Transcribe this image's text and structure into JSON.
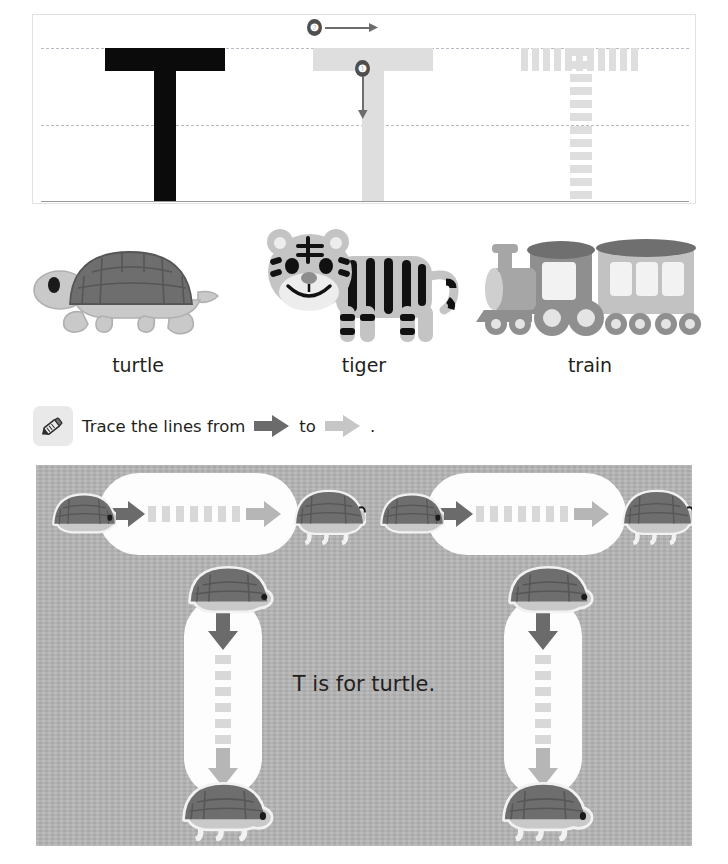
{
  "worksheet": {
    "letter": "T",
    "letter_case": "uppercase",
    "stroke_order": [
      {
        "number": "1",
        "direction": "down",
        "label_glyph": "❶"
      },
      {
        "number": "2",
        "direction": "right",
        "label_glyph": "❷"
      }
    ],
    "trace_models": [
      {
        "style": "solid",
        "color": "#0b0b0b",
        "name": "model-letter"
      },
      {
        "style": "ghost",
        "color": "#dededf",
        "name": "guided-letter"
      },
      {
        "style": "dotted",
        "color": "#dededf",
        "name": "dotted-letter"
      }
    ]
  },
  "pictures": [
    {
      "label": "turtle",
      "icon": "turtle-icon"
    },
    {
      "label": "tiger",
      "icon": "tiger-icon"
    },
    {
      "label": "train",
      "icon": "train-icon"
    }
  ],
  "instruction": {
    "icon": "crayon-icon",
    "text_before": "Trace the lines from",
    "text_middle": "to",
    "text_after": ".",
    "start_arrow": "dark-arrow-icon",
    "end_arrow": "light-arrow-icon"
  },
  "activity": {
    "caption": "T is for turtle.",
    "background_color": "#b4b4b4",
    "lane_color": "#fdfdfd",
    "start_arrow_color": "#6b6b6b",
    "end_arrow_color": "#b6b6b6",
    "dash_color": "#d8d8d8",
    "horizontal_lanes": [
      {
        "name": "lane-horizontal-left",
        "start_turtle": "turtle-facing-right",
        "end_turtle": "turtle-facing-right"
      },
      {
        "name": "lane-horizontal-right",
        "start_turtle": "turtle-facing-right",
        "end_turtle": "turtle-facing-right"
      }
    ],
    "vertical_lanes": [
      {
        "name": "lane-vertical-left",
        "start_turtle": "turtle-top",
        "end_turtle": "turtle-bottom"
      },
      {
        "name": "lane-vertical-right",
        "start_turtle": "turtle-top",
        "end_turtle": "turtle-bottom"
      }
    ]
  },
  "colors": {
    "ink_black": "#231f20",
    "guide_dash": "#b9b9c6",
    "baseline": "#9a9a9a",
    "shell_dark": "#6e6e6e",
    "shell_line": "#565656",
    "body_light": "#c9c9c9",
    "tiger_body": "#c4c4c4",
    "tiger_stripe": "#111111",
    "train_dark": "#6f6f6f",
    "train_mid": "#8f8f8f",
    "train_light": "#c2c2c2"
  }
}
